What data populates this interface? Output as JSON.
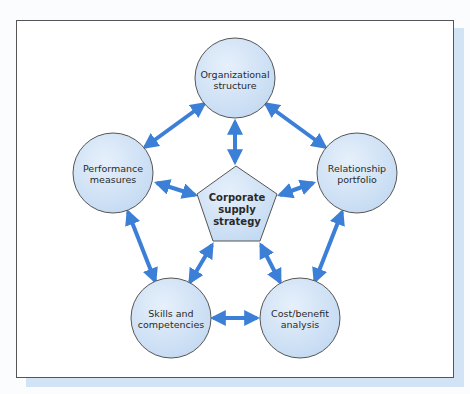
{
  "diagram": {
    "center": {
      "lines": [
        "Corporate",
        "supply",
        "strategy"
      ]
    },
    "nodes": [
      {
        "id": "organizational-structure",
        "lines": [
          "Organizational",
          "structure"
        ]
      },
      {
        "id": "performance-measures",
        "lines": [
          "Performance",
          "measures"
        ]
      },
      {
        "id": "relationship-portfolio",
        "lines": [
          "Relationship",
          "portfolio"
        ]
      },
      {
        "id": "skills-and-competencies",
        "lines": [
          "Skills and",
          "competencies"
        ]
      },
      {
        "id": "cost-benefit-analysis",
        "lines": [
          "Cost/benefit",
          "analysis"
        ]
      }
    ],
    "colors": {
      "arrow": "#3b7fd6",
      "node_fill": "#d3e4f6",
      "node_stroke": "#555555",
      "shadow": "#d3e3f6"
    }
  }
}
